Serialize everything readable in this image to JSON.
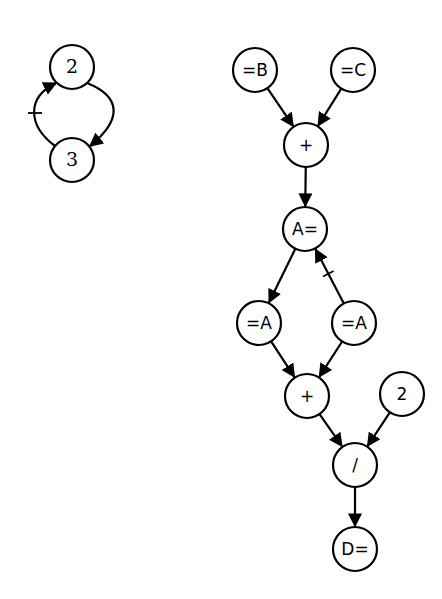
{
  "diagram": {
    "title": "",
    "colors": {
      "stroke": "#000000",
      "fill": "#ffffff",
      "background": "#ffffff"
    },
    "node_radius": 22,
    "left_cycle": {
      "nodes": [
        {
          "id": "n2",
          "label": "2",
          "x": 72,
          "y": 67
        },
        {
          "id": "n3",
          "label": "3",
          "x": 72,
          "y": 160
        }
      ],
      "edges": [
        {
          "from": "n2",
          "to": "n3",
          "style": "curved-right",
          "negated": false
        },
        {
          "from": "n3",
          "to": "n2",
          "style": "curved-left",
          "negated": true
        }
      ]
    },
    "right_graph": {
      "nodes": [
        {
          "id": "eqB",
          "label": "=B",
          "x": 255,
          "y": 70
        },
        {
          "id": "eqC",
          "label": "=C",
          "x": 353,
          "y": 70
        },
        {
          "id": "plus1",
          "label": "+",
          "x": 306,
          "y": 145
        },
        {
          "id": "Aeq",
          "label": "A=",
          "x": 305,
          "y": 229
        },
        {
          "id": "eqA1",
          "label": "=A",
          "x": 259,
          "y": 323
        },
        {
          "id": "eqA2",
          "label": "=A",
          "x": 354,
          "y": 323
        },
        {
          "id": "plus2",
          "label": "+",
          "x": 307,
          "y": 396
        },
        {
          "id": "two",
          "label": "2",
          "x": 402,
          "y": 394
        },
        {
          "id": "div",
          "label": "/",
          "x": 355,
          "y": 465
        },
        {
          "id": "Deq",
          "label": "D=",
          "x": 355,
          "y": 549
        }
      ],
      "edges": [
        {
          "from": "eqB",
          "to": "plus1",
          "negated": false
        },
        {
          "from": "eqC",
          "to": "plus1",
          "negated": false
        },
        {
          "from": "plus1",
          "to": "Aeq",
          "negated": false
        },
        {
          "from": "Aeq",
          "to": "eqA1",
          "negated": false
        },
        {
          "from": "eqA2",
          "to": "Aeq",
          "negated": true
        },
        {
          "from": "eqA1",
          "to": "plus2",
          "negated": false
        },
        {
          "from": "eqA2",
          "to": "plus2",
          "negated": false
        },
        {
          "from": "plus2",
          "to": "div",
          "negated": false
        },
        {
          "from": "two",
          "to": "div",
          "negated": false
        },
        {
          "from": "div",
          "to": "Deq",
          "negated": false
        }
      ]
    }
  }
}
